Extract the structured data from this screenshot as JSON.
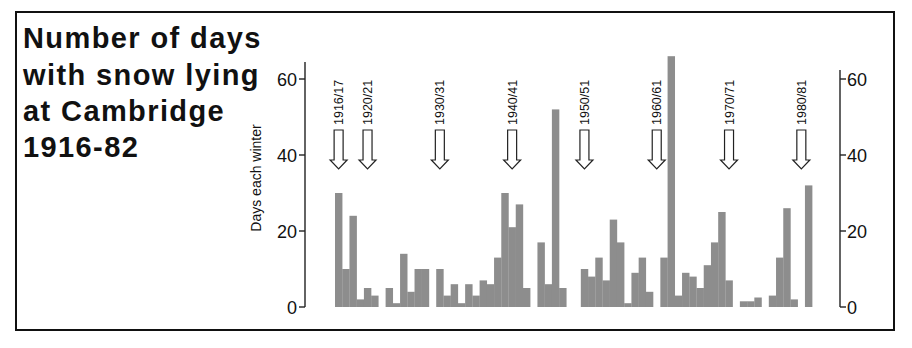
{
  "title": {
    "lines": [
      "Number of days",
      "with snow lying",
      "at Cambridge",
      "1916-82"
    ]
  },
  "axes": {
    "left": {
      "label": "Days each winter",
      "ticks": [
        0,
        20,
        40,
        60
      ],
      "tick_labels": [
        "0",
        "20",
        "40",
        "60"
      ]
    },
    "right": {
      "ticks": [
        0,
        20,
        40,
        60
      ],
      "tick_labels": [
        "0",
        "20",
        "40",
        "60"
      ]
    }
  },
  "markers": [
    {
      "label": "1916/17",
      "index": 0,
      "icon": "down-arrow-icon"
    },
    {
      "label": "1920/21",
      "index": 4,
      "icon": "down-arrow-icon"
    },
    {
      "label": "1930/31",
      "index": 14,
      "icon": "down-arrow-icon"
    },
    {
      "label": "1940/41",
      "index": 24,
      "icon": "down-arrow-icon"
    },
    {
      "label": "1950/51",
      "index": 34,
      "icon": "down-arrow-icon"
    },
    {
      "label": "1960/61",
      "index": 44,
      "icon": "down-arrow-icon"
    },
    {
      "label": "1970/71",
      "index": 54,
      "icon": "down-arrow-icon"
    },
    {
      "label": "1980/81",
      "index": 64,
      "icon": "down-arrow-icon"
    }
  ],
  "colors": {
    "bar": "#8d8d8d",
    "frame": "#111111",
    "axis": "#222222",
    "arrow_fill": "#ffffff",
    "arrow_stroke": "#222222",
    "text": "#111111"
  },
  "chart_data": {
    "type": "bar",
    "title": "Number of days with snow lying at Cambridge 1916-82",
    "xlabel": "",
    "ylabel": "Days each winter",
    "ylim": [
      0,
      65
    ],
    "yticks": [
      0,
      20,
      40,
      60
    ],
    "secondary_yticks": [
      0,
      20,
      40,
      60
    ],
    "grid": false,
    "legend": null,
    "categories": [
      "1916/17",
      "1917/18",
      "1918/19",
      "1919/20",
      "1920/21",
      "1921/22",
      "1922/23",
      "1923/24",
      "1924/25",
      "1925/26",
      "1926/27",
      "1927/28",
      "1928/29",
      "1929/30",
      "1930/31",
      "1931/32",
      "1932/33",
      "1933/34",
      "1934/35",
      "1935/36",
      "1936/37",
      "1937/38",
      "1938/39",
      "1939/40",
      "1940/41",
      "1941/42",
      "1942/43",
      "1943/44",
      "1944/45",
      "1945/46",
      "1946/47",
      "1947/48",
      "1948/49",
      "1949/50",
      "1950/51",
      "1951/52",
      "1952/53",
      "1953/54",
      "1954/55",
      "1955/56",
      "1956/57",
      "1957/58",
      "1958/59",
      "1959/60",
      "1960/61",
      "1961/62",
      "1962/63",
      "1963/64",
      "1964/65",
      "1965/66",
      "1966/67",
      "1967/68",
      "1968/69",
      "1969/70",
      "1970/71",
      "1971/72",
      "1972/73",
      "1973/74",
      "1974/75",
      "1975/76",
      "1976/77",
      "1977/78",
      "1978/79",
      "1979/80",
      "1980/81",
      "1981/82"
    ],
    "values": [
      30,
      10,
      24,
      2,
      5,
      3,
      0,
      5,
      1,
      14,
      4,
      10,
      10,
      0,
      10,
      3,
      6,
      1,
      6,
      3,
      7,
      6,
      13,
      30,
      21,
      27,
      5,
      0,
      17,
      6,
      52,
      5,
      0,
      0,
      10,
      8,
      13,
      7,
      23,
      17,
      1,
      9,
      13,
      4,
      0,
      13,
      66,
      3,
      9,
      8,
      5,
      11,
      17,
      25,
      7,
      0,
      1.5,
      1.5,
      2.5,
      0,
      3,
      13,
      26,
      2,
      0,
      32
    ],
    "annotations": [
      "1916/17",
      "1920/21",
      "1930/31",
      "1940/41",
      "1950/51",
      "1960/61",
      "1970/71",
      "1980/81"
    ]
  }
}
